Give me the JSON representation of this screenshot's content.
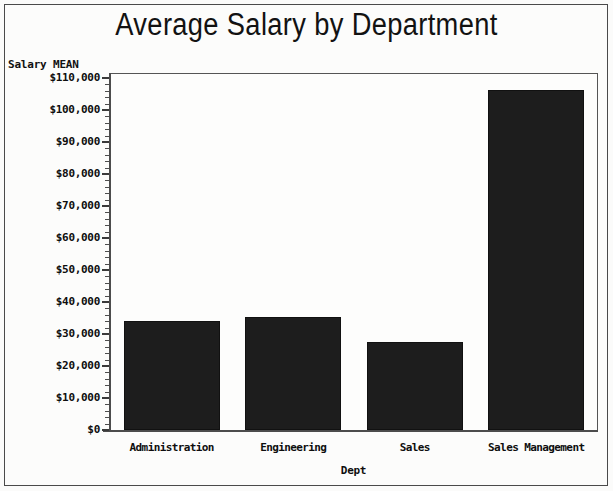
{
  "chart_data": {
    "type": "bar",
    "title": "Average Salary by Department",
    "xlabel": "Dept",
    "ylabel": "Salary MEAN",
    "categories": [
      "Administration",
      "Engineering",
      "Sales",
      "Sales Management"
    ],
    "values": [
      34000,
      35400,
      27400,
      106400
    ],
    "ylim": [
      0,
      110000
    ],
    "ytick_values": [
      0,
      10000,
      20000,
      30000,
      40000,
      50000,
      60000,
      70000,
      80000,
      90000,
      100000,
      110000
    ],
    "ytick_labels": [
      "$0",
      "$10,000",
      "$20,000",
      "$30,000",
      "$40,000",
      "$50,000",
      "$60,000",
      "$70,000",
      "$80,000",
      "$90,000",
      "$100,000",
      "$110,000"
    ],
    "minor_ticks_per_interval": 4,
    "grid": false,
    "legend": false,
    "bar_color": "#1d1d1d",
    "background_color": "#fcfcfb",
    "axis_color": "#4c4c4c"
  },
  "chart": {
    "title": "Average Salary by Department",
    "y_axis_caption": "Salary MEAN",
    "x_axis_caption": "Dept"
  }
}
